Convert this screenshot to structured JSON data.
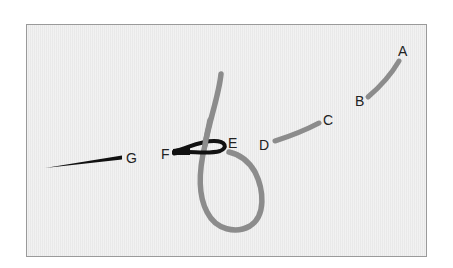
{
  "diagram": {
    "type": "embroidery-stitch-diagram",
    "colors": {
      "background": "#ffffff",
      "frame_fill": "#ededed",
      "frame_border": "#9a9a9a",
      "thread": "#8c8c8c",
      "needle": "#111111",
      "label_text": "#222222"
    },
    "points": [
      {
        "id": "A",
        "label": "A",
        "x": 398,
        "y": 44
      },
      {
        "id": "B",
        "label": "B",
        "x": 355,
        "y": 94
      },
      {
        "id": "C",
        "label": "C",
        "x": 323,
        "y": 113
      },
      {
        "id": "D",
        "label": "D",
        "x": 259,
        "y": 138
      },
      {
        "id": "E",
        "label": "E",
        "x": 228,
        "y": 136
      },
      {
        "id": "F",
        "label": "F",
        "x": 161,
        "y": 147
      },
      {
        "id": "G",
        "label": "G",
        "x": 126,
        "y": 151
      }
    ],
    "threads": [
      {
        "name": "stitch-a-b",
        "from": "A",
        "to": "B"
      },
      {
        "name": "stitch-c-d",
        "from": "C",
        "to": "D"
      },
      {
        "name": "working-thread-loop",
        "from": "E",
        "to": "top"
      }
    ],
    "needle": {
      "eye": "F",
      "point_end": "G"
    }
  }
}
